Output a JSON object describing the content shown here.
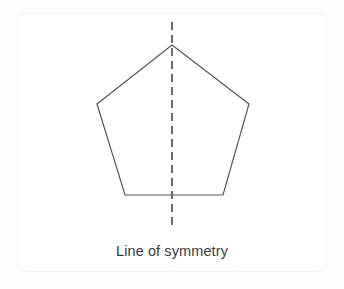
{
  "figure": {
    "caption": "Line of symmetry",
    "colors": {
      "page_background": "#fdfdfd",
      "card_background": "#ffffff",
      "card_border": "#f4f4f5",
      "shape_stroke": "#555555",
      "symmetry_line_stroke": "#6b6b6b",
      "caption_text": "#3c3c3c"
    },
    "shape": {
      "name": "pentagon",
      "sides": 5,
      "stroke_width": 1.2,
      "fill": "none",
      "points": "172,45 249,104 223,195 125,195 97,104",
      "vertices": [
        {
          "label": "apex",
          "x": 172,
          "y": 45
        },
        {
          "label": "upper-right",
          "x": 249,
          "y": 104
        },
        {
          "label": "lower-right",
          "x": 223,
          "y": 195
        },
        {
          "label": "lower-left",
          "x": 125,
          "y": 195
        },
        {
          "label": "upper-left",
          "x": 97,
          "y": 104
        }
      ]
    },
    "symmetry_line": {
      "orientation": "vertical",
      "style": "dashed",
      "dash_pattern": "8,5",
      "stroke_width": 2,
      "x": 172,
      "y_start": 22,
      "y_end": 227
    }
  }
}
